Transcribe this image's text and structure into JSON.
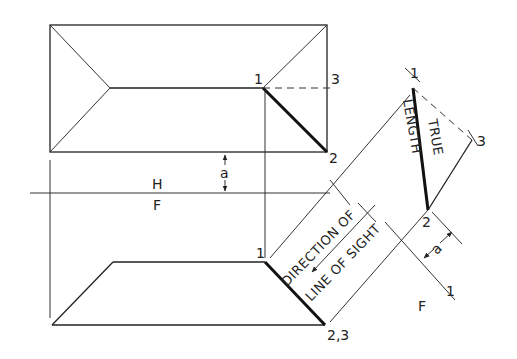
{
  "diagram": {
    "views": {
      "top_view": {
        "name": "Horizontal (H) view",
        "points": {
          "p1": "1",
          "p2": "2",
          "p3": "3"
        }
      },
      "front_view": {
        "name": "Frontal (F) view",
        "points": {
          "p1": "1",
          "p23": "2,3"
        }
      },
      "auxiliary_view": {
        "points": {
          "p1": "1",
          "p2": "2",
          "p3": "3"
        }
      }
    },
    "fold_lines": {
      "hf": {
        "top": "H",
        "bottom": "F"
      },
      "f1": {
        "left": "F",
        "right": "1"
      }
    },
    "dimension": {
      "distance_label": "a"
    },
    "annotations": {
      "line_of_sight_1": "DIRECTION OF",
      "line_of_sight_2": "LINE OF SIGHT",
      "true_length_1": "TRUE",
      "true_length_2": "LENGTH"
    }
  }
}
